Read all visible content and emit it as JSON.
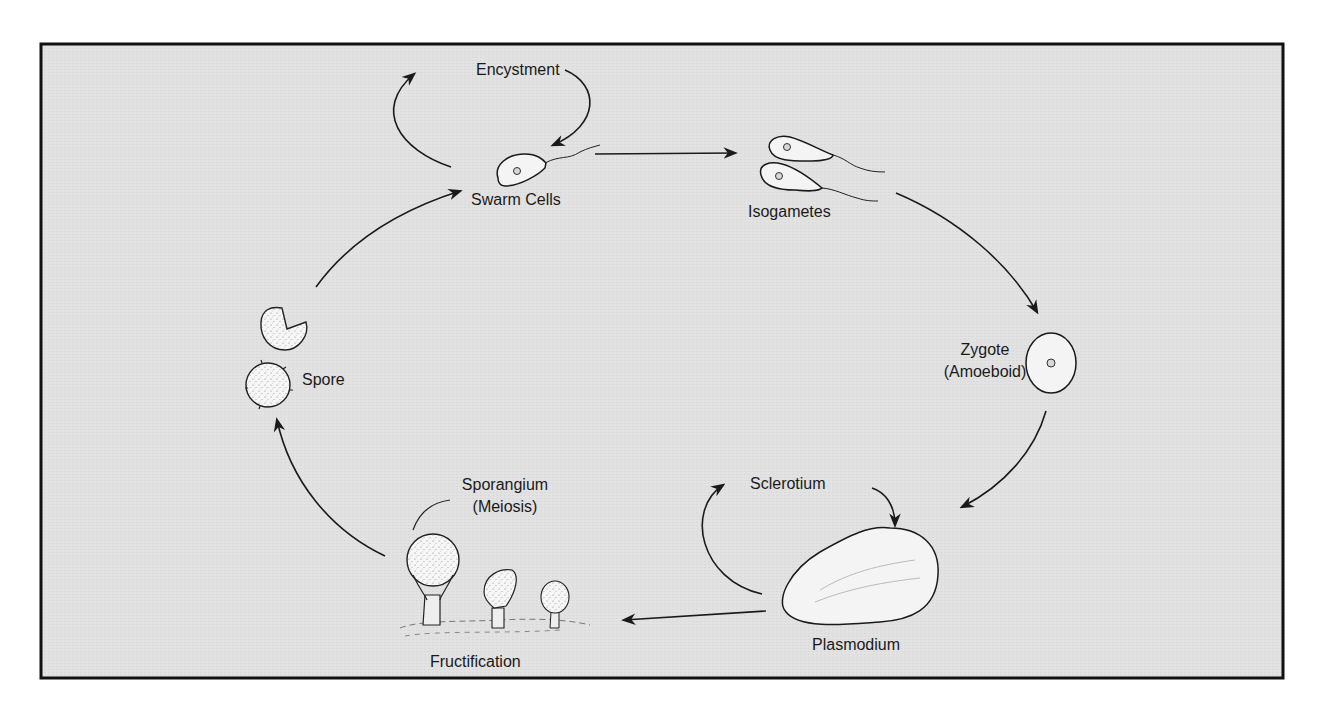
{
  "figure": {
    "type": "life-cycle-diagram",
    "colors": {
      "panel_background": "#e3e3e3",
      "frame": "#111111",
      "ink": "#1a1a1a",
      "cell_fill": "#f4f4f4"
    },
    "stages": {
      "encystment": {
        "label": "Encystment"
      },
      "swarm_cells": {
        "label": "Swarm Cells"
      },
      "isogametes": {
        "label": "Isogametes"
      },
      "zygote": {
        "label_line1": "Zygote",
        "label_line2": "(Amoeboid)"
      },
      "sclerotium": {
        "label": "Sclerotium"
      },
      "plasmodium": {
        "label": "Plasmodium"
      },
      "sporangium": {
        "label_line1": "Sporangium",
        "label_line2": "(Meiosis)"
      },
      "fructification": {
        "label": "Fructification"
      },
      "spore": {
        "label": "Spore"
      }
    },
    "transitions": [
      {
        "from": "Swarm Cells",
        "to": "Encystment"
      },
      {
        "from": "Encystment",
        "to": "Swarm Cells"
      },
      {
        "from": "Swarm Cells",
        "to": "Isogametes"
      },
      {
        "from": "Isogametes",
        "to": "Zygote (Amoeboid)"
      },
      {
        "from": "Zygote (Amoeboid)",
        "to": "Plasmodium"
      },
      {
        "from": "Plasmodium",
        "to": "Sclerotium"
      },
      {
        "from": "Sclerotium",
        "to": "Plasmodium"
      },
      {
        "from": "Plasmodium",
        "to": "Fructification"
      },
      {
        "from": "Fructification",
        "to": "Spore"
      },
      {
        "from": "Spore",
        "to": "Swarm Cells"
      }
    ]
  }
}
